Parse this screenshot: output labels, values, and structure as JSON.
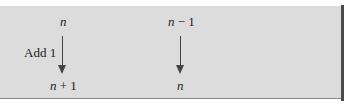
{
  "diagram": {
    "left_mapping": {
      "top_var": "n",
      "label": "Add 1",
      "bottom_var": "n",
      "bottom_op": " + 1"
    },
    "right_mapping": {
      "top_var": "n",
      "top_op": " − 1",
      "bottom_var": "n"
    }
  },
  "colors": {
    "panel_background": "#dcdcdc",
    "border": "#4a4a4a",
    "text": "#222222"
  }
}
